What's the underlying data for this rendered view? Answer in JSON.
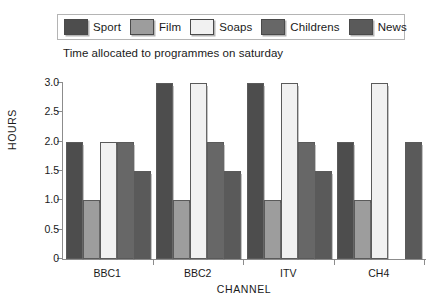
{
  "legend": {
    "items": [
      {
        "label": "Sport",
        "color": "#4d4d4d"
      },
      {
        "label": "Film",
        "color": "#9d9d9d"
      },
      {
        "label": "Soaps",
        "color": "#f1f1f1"
      },
      {
        "label": "Childrens",
        "color": "#676767"
      },
      {
        "label": "News",
        "color": "#5a5a5a"
      }
    ]
  },
  "chart_data": {
    "type": "bar",
    "title": "Time allocated to programmes on saturday",
    "xlabel": "CHANNEL",
    "ylabel": "HOURS",
    "categories": [
      "BBC1",
      "BBC2",
      "ITV",
      "CH4"
    ],
    "series": [
      {
        "name": "Sport",
        "color": "#4d4d4d",
        "values": [
          2.0,
          3.0,
          3.0,
          2.0
        ]
      },
      {
        "name": "Film",
        "color": "#9d9d9d",
        "values": [
          1.0,
          1.0,
          1.0,
          1.0
        ]
      },
      {
        "name": "Soaps",
        "color": "#f1f1f1",
        "values": [
          2.0,
          3.0,
          3.0,
          3.0
        ]
      },
      {
        "name": "Childrens",
        "color": "#676767",
        "values": [
          2.0,
          2.0,
          2.0,
          0.0
        ]
      },
      {
        "name": "News",
        "color": "#5a5a5a",
        "values": [
          1.5,
          1.5,
          1.5,
          2.0
        ]
      }
    ],
    "ylim": [
      0,
      3.0
    ],
    "yticks": [
      0,
      0.5,
      1.0,
      1.5,
      2.0,
      2.5,
      3.0
    ],
    "ytick_labels": [
      "0",
      "0.5",
      "1.0",
      "1.5",
      "2.0",
      "2.5",
      "3.0"
    ],
    "grid": false,
    "legend_position": "top"
  }
}
